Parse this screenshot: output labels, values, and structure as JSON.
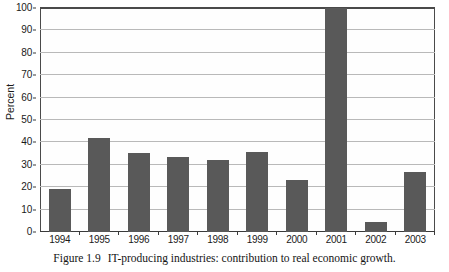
{
  "chart_data": {
    "type": "bar",
    "title": "",
    "subtitle": "",
    "xlabel": "",
    "ylabel": "Percent",
    "categories": [
      "1994",
      "1995",
      "1996",
      "1997",
      "1998",
      "1999",
      "2000",
      "2001",
      "2002",
      "2003"
    ],
    "values": [
      19.3,
      42.0,
      35.3,
      33.5,
      32.2,
      35.6,
      23.0,
      100.0,
      4.3,
      27.0
    ],
    "ylim": [
      0,
      100
    ],
    "y_ticks": [
      0,
      10,
      20,
      30,
      40,
      50,
      60,
      70,
      80,
      90,
      100
    ],
    "y_tick_labels": [
      "0",
      "10",
      "20",
      "30",
      "40",
      "50",
      "60",
      "70",
      "80",
      "90",
      "100"
    ],
    "grid": true,
    "grid_axis": "y",
    "legend": false,
    "legend_position": "none",
    "bar_color": "#595959",
    "gridline_color": "#b9b9b9",
    "axis_color": "#3a3a3a"
  },
  "caption": {
    "label": "Figure 1.9",
    "text": "IT-producing industries: contribution to real economic growth."
  }
}
